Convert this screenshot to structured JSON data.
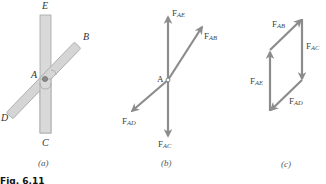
{
  "figure": {
    "caption": "Fig. 6.11",
    "colors": {
      "member_fill": "#d9d9d9",
      "member_stroke": "#9a9a9a",
      "arrow": "#8c8c8c",
      "text": "#333333"
    }
  },
  "panel_a": {
    "label": "(a)",
    "points": {
      "E": "E",
      "B": "B",
      "A": "A",
      "D": "D",
      "C": "C"
    }
  },
  "panel_b": {
    "label": "(b)",
    "point": "A",
    "forces": {
      "AE": {
        "base": "F",
        "sub": "AE"
      },
      "AB": {
        "base": "F",
        "sub": "AB"
      },
      "AD": {
        "base": "F",
        "sub": "AD"
      },
      "AC": {
        "base": "F",
        "sub": "AC"
      }
    }
  },
  "panel_c": {
    "label": "(c)",
    "forces": {
      "AB": {
        "base": "F",
        "sub": "AB"
      },
      "AC": {
        "base": "F",
        "sub": "AC"
      },
      "AE": {
        "base": "F",
        "sub": "AE"
      },
      "AD": {
        "base": "F",
        "sub": "AD"
      }
    }
  }
}
